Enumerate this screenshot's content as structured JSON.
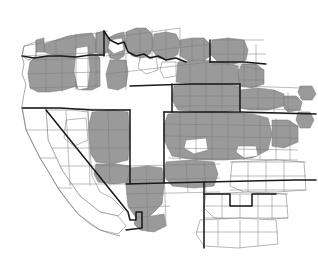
{
  "map": {
    "type": "choropleth",
    "region": "Western United States",
    "unit": "county",
    "background_color": "#ffffff",
    "shaded_color": "#9a9a9a",
    "unshaded_color": "#ffffff",
    "county_border_color": "#7a7a7a",
    "state_border_color": "#1a1a1a",
    "categories": [
      {
        "key": "shaded",
        "color": "#9a9a9a"
      },
      {
        "key": "unshaded",
        "color": "#ffffff"
      }
    ],
    "states": [
      {
        "code": "WA",
        "fill": "mixed"
      },
      {
        "code": "OR",
        "fill": "mixed"
      },
      {
        "code": "ID",
        "fill": "mixed"
      },
      {
        "code": "MT",
        "fill": "mixed"
      },
      {
        "code": "WY",
        "fill": "mixed"
      },
      {
        "code": "CA",
        "fill": "unshaded"
      },
      {
        "code": "NV",
        "fill": "unshaded"
      },
      {
        "code": "UT",
        "fill": "mixed"
      },
      {
        "code": "CO",
        "fill": "mixed"
      },
      {
        "code": "AZ",
        "fill": "mixed"
      },
      {
        "code": "NM",
        "fill": "mixed"
      },
      {
        "code": "ND",
        "fill": "mixed"
      },
      {
        "code": "SD",
        "fill": "mixed"
      },
      {
        "code": "NE",
        "fill": "mixed"
      },
      {
        "code": "KS",
        "fill": "unshaded"
      },
      {
        "code": "OK",
        "fill": "unshaded"
      },
      {
        "code": "TX",
        "fill": "unshaded"
      }
    ]
  }
}
